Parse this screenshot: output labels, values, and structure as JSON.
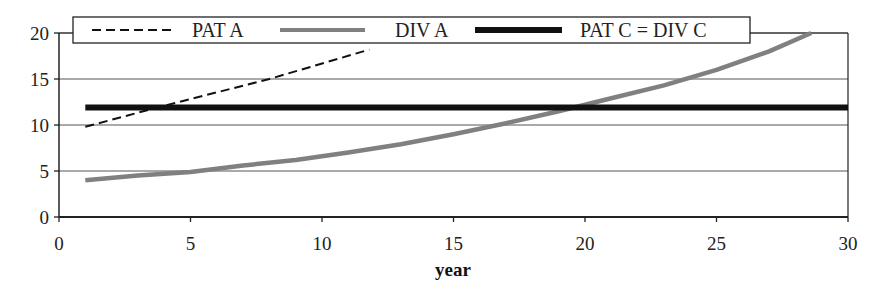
{
  "chart_data": {
    "type": "line",
    "title": "",
    "xlabel": "year",
    "ylabel": "",
    "xlim": [
      0,
      30
    ],
    "ylim": [
      0,
      20
    ],
    "x_ticks": [
      0,
      5,
      10,
      15,
      20,
      25,
      30
    ],
    "y_ticks": [
      0,
      5,
      10,
      15,
      20
    ],
    "grid": {
      "horizontal": true,
      "vertical": false
    },
    "legend": {
      "position": "top",
      "entries": [
        "PAT A",
        "DIV A",
        "PAT C = DIV C"
      ]
    },
    "series": [
      {
        "name": "PAT A",
        "style": "dashed",
        "color": "#111111",
        "x": [
          1,
          4,
          8,
          11.8
        ],
        "y": [
          9.8,
          12.1,
          15.0,
          18.2
        ]
      },
      {
        "name": "DIV A",
        "style": "solid-thick",
        "color": "#808080",
        "x": [
          1,
          3,
          5,
          7,
          9,
          11,
          13,
          15,
          17,
          19,
          21,
          23,
          25,
          27,
          28.6
        ],
        "y": [
          4.0,
          4.5,
          4.9,
          5.6,
          6.2,
          7.0,
          7.9,
          9.0,
          10.2,
          11.5,
          12.9,
          14.3,
          16.0,
          18.0,
          20.0
        ]
      },
      {
        "name": "PAT C = DIV C",
        "style": "solid-heavy",
        "color": "#111111",
        "x": [
          1,
          30
        ],
        "y": [
          11.9,
          11.9
        ]
      }
    ]
  },
  "legend": {
    "items": [
      {
        "label": "PAT A"
      },
      {
        "label": "DIV A"
      },
      {
        "label": "PAT C = DIV C"
      }
    ]
  },
  "axes": {
    "x_title": "year",
    "x_tick_labels": [
      "0",
      "5",
      "10",
      "15",
      "20",
      "25",
      "30"
    ],
    "y_tick_labels": [
      "0",
      "5",
      "10",
      "15",
      "20"
    ]
  },
  "colors": {
    "axis": "#222222",
    "grid": "#555555",
    "pat_a": "#111111",
    "div_a": "#808080",
    "pat_c": "#111111"
  }
}
